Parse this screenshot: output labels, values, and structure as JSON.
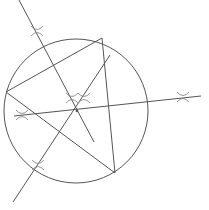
{
  "diagram": {
    "stroke_color": "#555555",
    "arc_color": "#8a8a8a",
    "circle": {
      "cx": 76,
      "cy": 111,
      "r": 72
    },
    "triangle": {
      "vertices": [
        {
          "id": "A",
          "x": 102,
          "y": 38
        },
        {
          "id": "B",
          "x": 6,
          "y": 92
        },
        {
          "id": "C",
          "x": 115,
          "y": 173
        }
      ]
    },
    "circumcenter": {
      "x": 77,
      "y": 111
    },
    "bisectors": [
      {
        "id": "bisector-AB",
        "x1": 19,
        "y1": 0,
        "x2": 94,
        "y2": 142
      },
      {
        "id": "bisector-BC",
        "x1": 14,
        "y1": 116,
        "x2": 201,
        "y2": 96
      },
      {
        "id": "bisector-CA",
        "x1": 13,
        "y1": 202,
        "x2": 110,
        "y2": 55
      }
    ],
    "arc_marks": [
      {
        "id": "arc-AB-outer",
        "x": 37,
        "y": 31
      },
      {
        "id": "arc-AB-inner",
        "x": 72,
        "y": 98
      },
      {
        "id": "arc-BC-inner",
        "x": 22,
        "y": 115
      },
      {
        "id": "arc-BC-outer",
        "x": 183,
        "y": 97
      },
      {
        "id": "arc-CA-inner",
        "x": 84,
        "y": 98
      },
      {
        "id": "arc-CA-outer",
        "x": 38,
        "y": 165
      }
    ]
  }
}
